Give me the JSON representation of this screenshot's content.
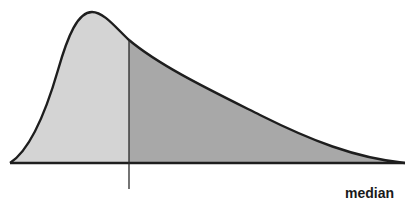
{
  "figure": {
    "type": "skewed-distribution-diagram",
    "marker_label": "median",
    "regions": [
      {
        "name": "below-median",
        "shade": "light",
        "color": "#d4d4d4"
      },
      {
        "name": "above-median",
        "shade": "dark",
        "color": "#a8a8a8"
      }
    ],
    "curve_color": "#1e1e1e",
    "median_line_color": "#2a2a2a"
  }
}
